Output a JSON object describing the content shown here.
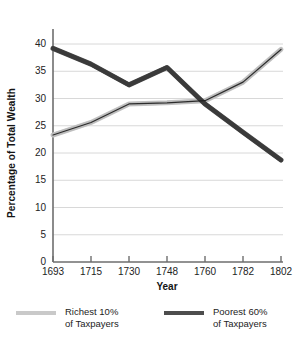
{
  "chart_data": {
    "type": "line",
    "title": "",
    "xlabel": "Year",
    "ylabel": "Percentage of Total Wealth",
    "x": [
      1693,
      1715,
      1730,
      1748,
      1760,
      1782,
      1802
    ],
    "xtick_labels": [
      "1693",
      "1715",
      "1730",
      "1748",
      "1760",
      "1782",
      "1802"
    ],
    "ytick_labels": [
      "0",
      "5",
      "10",
      "15",
      "20",
      "25",
      "30",
      "35",
      "40"
    ],
    "ytick_values": [
      0,
      5,
      10,
      15,
      20,
      25,
      30,
      35,
      40
    ],
    "ylim": [
      0,
      40
    ],
    "grid": "horizontal",
    "legend_position": "bottom",
    "series": [
      {
        "name": "Richest 10% of Taxpayers",
        "legend_line1": "Richest 10%",
        "legend_line2": "of Taxpayers",
        "color": "#c9c9c9",
        "values": [
          23.3,
          25.6,
          29.0,
          29.2,
          29.6,
          33.0,
          39.0
        ]
      },
      {
        "name": "Poorest 60% of Taxpayers",
        "legend_line1": "Poorest 60%",
        "legend_line2": "of Taxpayers",
        "color": "#4d4d4d",
        "values": [
          39.2,
          36.3,
          32.5,
          35.7,
          29.0,
          23.8,
          18.7
        ]
      }
    ],
    "colors": {
      "axis": "#6e6e6e",
      "grid": "#d8d8d8",
      "text": "#232323",
      "outline": "#1c1c1c",
      "background": "#ffffff"
    }
  }
}
